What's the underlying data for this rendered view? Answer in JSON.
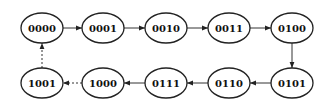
{
  "diagram": {
    "type": "state-transition",
    "node_style": {
      "shape": "ellipse",
      "rx": 21,
      "ry": 15,
      "stroke": "#222222",
      "fill": "#ffffff"
    },
    "nodes": [
      {
        "id": "n0",
        "label": "0000",
        "cx": 42,
        "cy": 28
      },
      {
        "id": "n1",
        "label": "0001",
        "cx": 103,
        "cy": 28
      },
      {
        "id": "n2",
        "label": "0010",
        "cx": 166,
        "cy": 28
      },
      {
        "id": "n3",
        "label": "0011",
        "cx": 229,
        "cy": 28
      },
      {
        "id": "n4",
        "label": "0100",
        "cx": 292,
        "cy": 28
      },
      {
        "id": "n5",
        "label": "0101",
        "cx": 292,
        "cy": 83
      },
      {
        "id": "n6",
        "label": "0110",
        "cx": 229,
        "cy": 83
      },
      {
        "id": "n7",
        "label": "0111",
        "cx": 166,
        "cy": 83
      },
      {
        "id": "n8",
        "label": "1000",
        "cx": 103,
        "cy": 83
      },
      {
        "id": "n9",
        "label": "1001",
        "cx": 42,
        "cy": 83
      }
    ],
    "edges": [
      {
        "from": "0000",
        "to": "0001",
        "style": "solid"
      },
      {
        "from": "0001",
        "to": "0010",
        "style": "solid"
      },
      {
        "from": "0010",
        "to": "0011",
        "style": "solid"
      },
      {
        "from": "0011",
        "to": "0100",
        "style": "solid"
      },
      {
        "from": "0100",
        "to": "0101",
        "style": "solid"
      },
      {
        "from": "0101",
        "to": "0110",
        "style": "solid"
      },
      {
        "from": "0110",
        "to": "0111",
        "style": "solid"
      },
      {
        "from": "0111",
        "to": "1000",
        "style": "solid"
      },
      {
        "from": "1000",
        "to": "1001",
        "style": "dashed"
      },
      {
        "from": "1001",
        "to": "0000",
        "style": "dashed"
      }
    ]
  }
}
